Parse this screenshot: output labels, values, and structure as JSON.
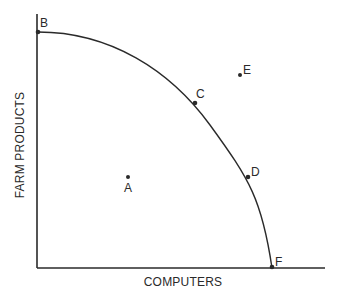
{
  "diagram": {
    "type": "production-possibilities-frontier",
    "x_axis_label": "COMPUTERS",
    "y_axis_label": "FARM PRODUCTS",
    "colors": {
      "ink": "#2a2a2a",
      "background": "#ffffff"
    },
    "points": [
      {
        "label": "A",
        "position": "inside frontier"
      },
      {
        "label": "B",
        "position": "on frontier, y-intercept"
      },
      {
        "label": "C",
        "position": "on frontier"
      },
      {
        "label": "D",
        "position": "on frontier"
      },
      {
        "label": "E",
        "position": "outside frontier"
      },
      {
        "label": "F",
        "position": "on frontier, x-intercept"
      }
    ]
  }
}
